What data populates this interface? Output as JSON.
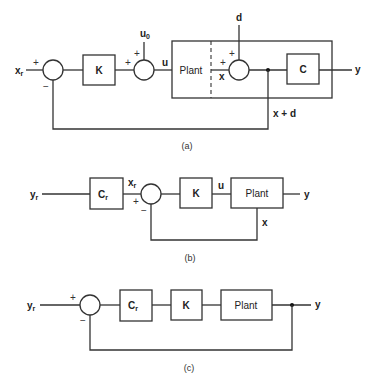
{
  "diagram_a": {
    "caption": "(a)",
    "input_label": "x",
    "input_sub": "r",
    "sum1_plus": "+",
    "sum1_minus": "−",
    "gain_block": "K",
    "u0_label": "u",
    "u0_sub": "0",
    "sum2_plus_top": "+",
    "sum2_plus_left": "+",
    "u_label": "u",
    "plant_label": "Plant",
    "x_label": "x",
    "d_label": "d",
    "sum3_plus_top": "+",
    "sum3_plus_left": "+",
    "output_block": "C",
    "output_label": "y",
    "feedback_label": "x + d"
  },
  "diagram_b": {
    "caption": "(b)",
    "input_label": "y",
    "input_sub": "r",
    "prefilter_block": "C",
    "prefilter_sub": "r",
    "xr_label": "x",
    "xr_sub": "r",
    "sum_plus": "+",
    "sum_minus": "−",
    "gain_block": "K",
    "u_label": "u",
    "plant_label": "Plant",
    "output_label": "y",
    "feedback_label": "x"
  },
  "diagram_c": {
    "caption": "(c)",
    "input_label": "y",
    "input_sub": "r",
    "sum_plus": "+",
    "sum_minus": "−",
    "prefilter_block": "C",
    "prefilter_sub": "r",
    "gain_block": "K",
    "plant_label": "Plant",
    "output_label": "y"
  }
}
